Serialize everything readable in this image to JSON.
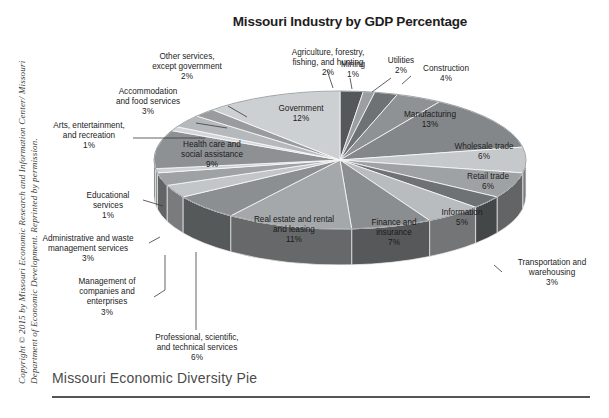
{
  "title": "Missouri Industry by GDP Percentage",
  "caption": "Missouri Economic Diversity Pie",
  "copyright": "Copyright © 2015 by Missouri Economic Research and Information Center/ Missouri Department of Economic Development. Reprinted by permission.",
  "chart_data": {
    "type": "pie",
    "title": "Missouri Industry by GDP Percentage",
    "xlabel": "",
    "ylabel": "",
    "legend": "none",
    "value_suffix": "%",
    "three_d": true,
    "start_angle_deg": 0,
    "direction": "clockwise",
    "categories": [
      "Agriculture, forestry, fishing, and hunting",
      "Mining",
      "Utilities",
      "Construction",
      "Manufacturing",
      "Wholesale trade",
      "Retail trade",
      "Transportation and warehousing",
      "Information",
      "Finance and insurance",
      "Real estate and rental and leasing",
      "Professional, scientific, and technical services",
      "Management of companies and enterprises",
      "Administrative and waste management services",
      "Educational services",
      "Health care and social assistance",
      "Arts, entertainment, and recreation",
      "Accommodation and food services",
      "Other services, except government",
      "Government"
    ],
    "values": [
      2,
      1,
      2,
      4,
      13,
      6,
      6,
      3,
      5,
      7,
      11,
      6,
      3,
      3,
      1,
      9,
      1,
      3,
      2,
      12
    ],
    "colors": [
      "#54585a",
      "#9b9fa1",
      "#6e7274",
      "#8e9294",
      "#83878a",
      "#c6c9cb",
      "#9ea2a4",
      "#6e7274",
      "#b9bcbe",
      "#8a8e90",
      "#a4a8aa",
      "#8b8f91",
      "#c3c6c8",
      "#9ea2a4",
      "#cfd2d4",
      "#8d9193",
      "#d4d7d9",
      "#b6b9bb",
      "#989c9e",
      "#cdd0d2"
    ]
  },
  "slice_labels": [
    {
      "name": "agriculture",
      "text": "Agriculture, forestry,\nfishing, and hunting\n2%",
      "pct": "2%"
    },
    {
      "name": "mining",
      "text": "Mining\n1%",
      "pct": "1%"
    },
    {
      "name": "utilities",
      "text": "Utilities\n2%",
      "pct": "2%"
    },
    {
      "name": "construction",
      "text": "Construction\n4%",
      "pct": "4%"
    },
    {
      "name": "manufacturing",
      "text": "Manufacturing\n13%",
      "pct": "13%"
    },
    {
      "name": "wholesale-trade",
      "text": "Wholesale trade\n6%",
      "pct": "6%"
    },
    {
      "name": "retail-trade",
      "text": "Retail trade\n6%",
      "pct": "6%"
    },
    {
      "name": "transportation-warehousing",
      "text": "Transportation and\nwarehousing\n3%",
      "pct": "3%"
    },
    {
      "name": "information",
      "text": "Information\n5%",
      "pct": "5%"
    },
    {
      "name": "finance-insurance",
      "text": "Finance and\ninsurance\n7%",
      "pct": "7%"
    },
    {
      "name": "real-estate",
      "text": "Real estate and rental\nand leasing\n11%",
      "pct": "11%"
    },
    {
      "name": "professional-scientific",
      "text": "Professional, scientific,\nand technical services\n6%",
      "pct": "6%"
    },
    {
      "name": "management-companies",
      "text": "Management of\ncompanies and\nenterprises\n3%",
      "pct": "3%"
    },
    {
      "name": "administrative-waste",
      "text": "Administrative and waste\nmanagement services\n3%",
      "pct": "3%"
    },
    {
      "name": "educational-services",
      "text": "Educational\nservices\n1%",
      "pct": "1%"
    },
    {
      "name": "health-care",
      "text": "Health care and\nsocial assistance\n9%",
      "pct": "9%"
    },
    {
      "name": "arts-entertainment",
      "text": "Arts, entertainment,\nand recreation\n1%",
      "pct": "1%"
    },
    {
      "name": "accommodation-food",
      "text": "Accommodation\nand food services\n3%",
      "pct": "3%"
    },
    {
      "name": "other-services",
      "text": "Other services,\nexcept government\n2%",
      "pct": "2%"
    },
    {
      "name": "government",
      "text": "Government\n12%",
      "pct": "12%"
    }
  ]
}
